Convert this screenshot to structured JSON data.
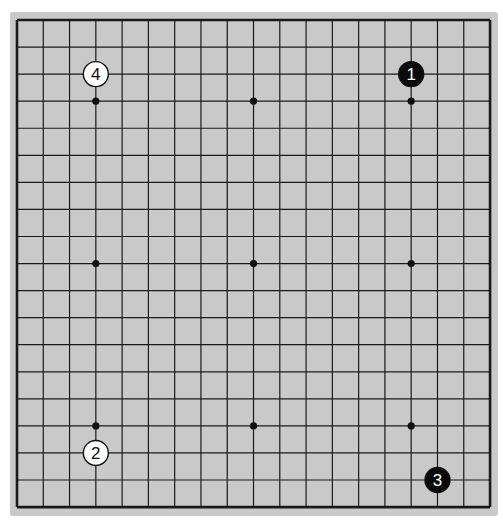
{
  "board": {
    "size": 19,
    "origin_x": 17,
    "origin_y": 20,
    "spacing_x": 26.28,
    "spacing_y": 27.06,
    "background": "#c9c9c9",
    "line_color": "#1a1a1a",
    "star_points": [
      [
        3,
        3
      ],
      [
        9,
        3
      ],
      [
        15,
        3
      ],
      [
        3,
        9
      ],
      [
        9,
        9
      ],
      [
        15,
        9
      ],
      [
        3,
        15
      ],
      [
        9,
        15
      ],
      [
        15,
        15
      ]
    ],
    "hidden_star_points": [
      [
        9,
        3
      ],
      [
        3,
        3
      ],
      [
        15,
        3
      ]
    ]
  },
  "stones": [
    {
      "number": "1",
      "color": "black",
      "col": 15,
      "row": 2
    },
    {
      "number": "2",
      "color": "white",
      "col": 3,
      "row": 16
    },
    {
      "number": "3",
      "color": "black",
      "col": 16,
      "row": 17
    },
    {
      "number": "4",
      "color": "white",
      "col": 3,
      "row": 2
    }
  ]
}
